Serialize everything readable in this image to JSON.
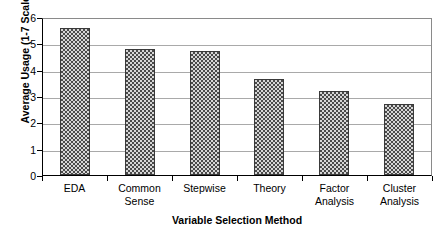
{
  "chart_data": {
    "type": "bar",
    "title": "",
    "xlabel": "Variable Selection Method",
    "ylabel": "Average Usage (1-7 Scale)",
    "categories": [
      "EDA",
      "Common Sense",
      "Stepwise",
      "Theory",
      "Factor Analysis",
      "Cluster Analysis"
    ],
    "category_lines": [
      [
        "EDA"
      ],
      [
        "Common",
        "Sense"
      ],
      [
        "Stepwise"
      ],
      [
        "Theory"
      ],
      [
        "Factor",
        "Analysis"
      ],
      [
        "Cluster",
        "Analysis"
      ]
    ],
    "values": [
      5.6,
      4.8,
      4.7,
      3.65,
      3.2,
      2.7
    ],
    "ylim": [
      0,
      6
    ],
    "yticks": [
      0,
      1,
      2,
      3,
      4,
      5,
      6
    ],
    "ytick_labels": [
      "0",
      "1",
      "2",
      "3",
      "4",
      "5",
      "6"
    ],
    "grid": true,
    "grid_axis": "y",
    "legend": false,
    "bar_fill": "#5a5a5a",
    "bar_pattern": "checkerboard-dotted",
    "bar_border_color": "#3a3a3a",
    "gridline_color": "#a9a9a9",
    "axis_color": "#000000",
    "background": "#ffffff"
  }
}
